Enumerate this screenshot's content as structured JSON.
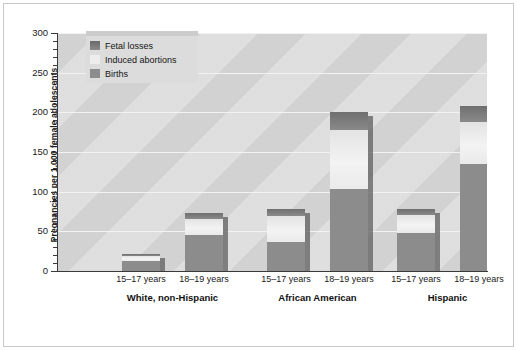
{
  "chart_data": {
    "type": "bar",
    "subtype": "stacked",
    "title": "",
    "xlabel": "",
    "ylabel": "Pregnancies per 1,000 female adolescents",
    "ylim": [
      0,
      300
    ],
    "ytick_step": 50,
    "yticks": [
      "0",
      "50",
      "100",
      "150",
      "200",
      "250",
      "300"
    ],
    "minor_tick_step": 10,
    "grid": true,
    "grid_axis": "y",
    "legend_position": "upper-left-inside",
    "categories": [
      "White, non-Hispanic 15–17 years",
      "White, non-Hispanic 18–19 years",
      "African American 15–17 years",
      "African American 18–19 years",
      "Hispanic 15–17 years",
      "Hispanic 18–19 years"
    ],
    "groups": [
      {
        "label": "White, non-Hispanic",
        "bars": [
          {
            "age": "15–17 years",
            "births": 12,
            "induced_abortions": 7,
            "fetal_losses": 3,
            "total": 22
          },
          {
            "age": "18–19 years",
            "births": 45,
            "induced_abortions": 21,
            "fetal_losses": 7,
            "total": 73
          }
        ]
      },
      {
        "label": "African American",
        "bars": [
          {
            "age": "15–17 years",
            "births": 37,
            "induced_abortions": 32,
            "fetal_losses": 9,
            "total": 78
          },
          {
            "age": "18–19 years",
            "births": 103,
            "induced_abortions": 75,
            "fetal_losses": 22,
            "total": 200
          }
        ]
      },
      {
        "label": "Hispanic",
        "bars": [
          {
            "age": "15–17 years",
            "births": 48,
            "induced_abortions": 22,
            "fetal_losses": 8,
            "total": 78
          },
          {
            "age": "18–19 years",
            "births": 135,
            "induced_abortions": 53,
            "fetal_losses": 20,
            "total": 208
          }
        ]
      }
    ],
    "series": [
      {
        "name": "Births",
        "values": [
          12,
          45,
          37,
          103,
          48,
          135
        ],
        "color": "#8c8c8c"
      },
      {
        "name": "Induced abortions",
        "values": [
          7,
          21,
          32,
          75,
          22,
          53
        ],
        "color": "#ededed"
      },
      {
        "name": "Fetal losses",
        "values": [
          3,
          7,
          9,
          22,
          8,
          20
        ],
        "color": "#787878"
      }
    ],
    "totals": [
      22,
      73,
      78,
      200,
      78,
      208
    ]
  },
  "legend": {
    "items": [
      {
        "label": "Fetal losses",
        "swatch": "fetal-losses-swatch"
      },
      {
        "label": "Induced abortions",
        "swatch": "induced-abortions-swatch"
      },
      {
        "label": "Births",
        "swatch": "births-swatch"
      }
    ]
  },
  "axes": {
    "y_title": "Pregnancies per 1,000 female adolescents",
    "y_ticks": [
      "300",
      "250",
      "200",
      "150",
      "100",
      "50",
      "0"
    ]
  },
  "x_axis": {
    "age_labels": [
      "15–17 years",
      "18–19 years",
      "15–17 years",
      "18–19 years",
      "15–17 years",
      "18–19 years"
    ],
    "group_labels": [
      "White, non-Hispanic",
      "African  American",
      "Hispanic"
    ]
  },
  "colors": {
    "plot_background": "#d2d2d2",
    "gridline": "#f2f2f2",
    "births": "#8c8c8c",
    "induced_abortions": "#ededed",
    "fetal_losses": "#787878",
    "axis": "#3a3a3a",
    "text": "#1a1a1a",
    "legend_background": "#dcdcdc"
  }
}
